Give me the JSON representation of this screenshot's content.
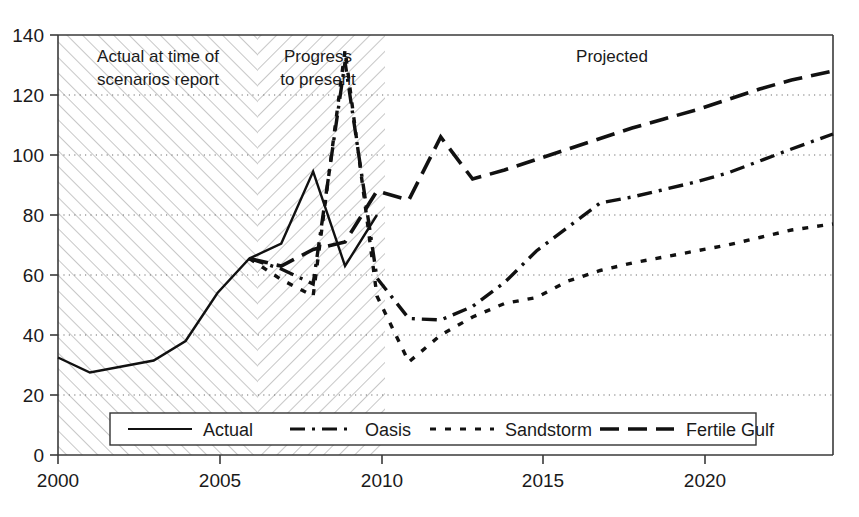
{
  "chart_data": {
    "type": "line",
    "title": "",
    "xlabel": "",
    "ylabel": "",
    "xlim": [
      2000,
      2024.3
    ],
    "ylim": [
      0,
      140
    ],
    "grid": "horizontal dotted gridlines at every 20 units",
    "legend_position": "inside bottom center",
    "x_ticks": [
      "2000",
      "2005",
      "2010",
      "2015",
      "2020"
    ],
    "x_tick_values": [
      2000,
      2005,
      2010,
      2015,
      2020
    ],
    "y_ticks": [
      "0",
      "20",
      "40",
      "60",
      "80",
      "100",
      "120",
      "140"
    ],
    "y_tick_values": [
      0,
      20,
      40,
      60,
      80,
      100,
      120,
      140
    ],
    "annotations": [
      {
        "text": "Actual at time of scenarios report",
        "x_range": [
          2000,
          2006
        ],
        "style": "forward-hatched band"
      },
      {
        "text": "Progress to present",
        "x_range": [
          2006,
          2010
        ],
        "style": "back-hatched band"
      },
      {
        "text": "Projected",
        "x_range": [
          2010,
          2024.3
        ],
        "style": "plain white"
      }
    ],
    "series": [
      {
        "name": "Actual",
        "dash": "solid",
        "x": [
          2000,
          2001,
          2002,
          2003,
          2004,
          2005,
          2006,
          2007,
          2008,
          2009,
          2010
        ],
        "values": [
          32.5,
          27.5,
          29.5,
          31.5,
          38,
          54,
          65.5,
          70.5,
          94.5,
          63,
          80
        ]
      },
      {
        "name": "Oasis",
        "dash": "dash-dot",
        "x": [
          2006,
          2007,
          2008,
          2009,
          2010,
          2011,
          2012,
          2013,
          2014,
          2015,
          2016,
          2017,
          2018,
          2019,
          2020,
          2021,
          2022,
          2023,
          2024.3
        ],
        "values": [
          65.5,
          62,
          57,
          131,
          59,
          45.5,
          45,
          49.5,
          57.5,
          68,
          76,
          84,
          86,
          88.5,
          91,
          94,
          98,
          102,
          107
        ]
      },
      {
        "name": "Sandstorm",
        "dash": "dotted",
        "x": [
          2006,
          2007,
          2008,
          2009,
          2010,
          2011,
          2012,
          2013,
          2014,
          2015,
          2016,
          2017,
          2018,
          2019,
          2020,
          2021,
          2022,
          2023,
          2024.3
        ],
        "values": [
          65.5,
          58.5,
          53,
          135,
          53,
          31,
          40,
          46,
          50.5,
          52.5,
          58,
          61.5,
          64,
          66,
          68,
          70,
          72.5,
          75,
          77
        ]
      },
      {
        "name": "Fertile Gulf",
        "dash": "long-dash",
        "x": [
          2006,
          2007,
          2008,
          2009,
          2010,
          2011,
          2012,
          2013,
          2014,
          2015,
          2016,
          2017,
          2018,
          2019,
          2020,
          2021,
          2022,
          2023,
          2024.3
        ],
        "values": [
          65.5,
          63,
          68.5,
          71,
          88,
          85,
          106,
          92,
          95,
          98.5,
          102,
          105.5,
          109,
          112,
          115,
          118.5,
          122,
          125,
          128
        ]
      }
    ]
  },
  "bands": {
    "actual_label_line1": "Actual at time of",
    "actual_label_line2": "scenarios report",
    "progress_label_line1": "Progress",
    "progress_label_line2": "to present",
    "projected_label": "Projected"
  },
  "legend": {
    "items": [
      {
        "label": "Actual",
        "dash": "solid"
      },
      {
        "label": "Oasis",
        "dash": "dash-dot"
      },
      {
        "label": "Sandstorm",
        "dash": "dotted"
      },
      {
        "label": "Fertile Gulf",
        "dash": "long-dash"
      }
    ]
  },
  "colors": {
    "line": "#111111",
    "axis": "#3a3a3a",
    "grid": "#808080",
    "hatch": "#b8b8b8",
    "background": "#ffffff"
  }
}
